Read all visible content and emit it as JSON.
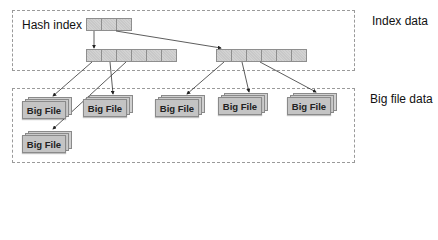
{
  "diagram": {
    "regions": {
      "index": {
        "label": "Index data"
      },
      "files": {
        "label": "Big file data"
      }
    },
    "hash_index_label": "Hash index",
    "root_bucket": {
      "cells": 3
    },
    "second_level_buckets": [
      {
        "cells": 6
      },
      {
        "cells": 6
      }
    ],
    "files": [
      {
        "label": "Big File"
      },
      {
        "label": "Big File"
      },
      {
        "label": "Big File"
      },
      {
        "label": "Big File"
      },
      {
        "label": "Big File"
      },
      {
        "label": "Big File"
      }
    ],
    "colors": {
      "cell_fill": "#c8c8c8",
      "cell_border": "#8e8e8e",
      "dashed_border": "#9a9a9a",
      "edge": "#333333"
    }
  }
}
